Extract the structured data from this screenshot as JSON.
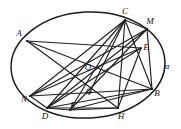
{
  "figure": {
    "background_color": "#ffffff",
    "stroke_color": "#1f1f1f",
    "width": 181,
    "height": 129,
    "conic": {
      "name": "alpha",
      "label": "α",
      "label_x": 167,
      "label_y": 66,
      "center_x": 88,
      "center_y": 65,
      "radius_x": 77,
      "radius_y": 53,
      "rotation_deg": -3
    },
    "points": [
      {
        "id": "A",
        "label": "A",
        "x": 27,
        "y": 41,
        "label_x": 19,
        "label_y": 33,
        "on_conic": true
      },
      {
        "id": "C",
        "label": "C",
        "x": 125,
        "y": 20,
        "label_x": 125,
        "label_y": 11,
        "on_conic": true
      },
      {
        "id": "M",
        "label": "M",
        "x": 147,
        "y": 29,
        "label_x": 150,
        "label_y": 21,
        "on_conic": true
      },
      {
        "id": "E",
        "label": "E",
        "x": 141,
        "y": 48,
        "label_x": 146,
        "label_y": 47,
        "on_conic": false
      },
      {
        "id": "B",
        "label": "B",
        "x": 152,
        "y": 89,
        "label_x": 157,
        "label_y": 93,
        "on_conic": true
      },
      {
        "id": "H",
        "label": "H",
        "x": 118,
        "y": 108,
        "label_x": 121,
        "label_y": 116,
        "on_conic": true
      },
      {
        "id": "F",
        "label": "F",
        "x": 70,
        "y": 110,
        "label_x": 73,
        "label_y": 105,
        "on_conic": false
      },
      {
        "id": "D",
        "label": "D",
        "x": 47,
        "y": 108,
        "label_x": 45,
        "label_y": 116,
        "on_conic": true
      },
      {
        "id": "N",
        "label": "N",
        "x": 30,
        "y": 96,
        "label_x": 24,
        "label_y": 99,
        "on_conic": true
      },
      {
        "id": "O",
        "label": "O",
        "x": 88,
        "y": 70,
        "label_x": 88,
        "label_y": 67,
        "on_conic": false
      },
      {
        "id": "G",
        "label": "G",
        "x": 89,
        "y": 94,
        "label_x": 89,
        "label_y": 91,
        "on_conic": false
      }
    ],
    "chords": [
      {
        "from": "A",
        "to": "B"
      },
      {
        "from": "A",
        "to": "H"
      },
      {
        "from": "A",
        "to": "E"
      },
      {
        "from": "C",
        "to": "N"
      },
      {
        "from": "C",
        "to": "D"
      },
      {
        "from": "C",
        "to": "F"
      },
      {
        "from": "C",
        "to": "G"
      },
      {
        "from": "C",
        "to": "H"
      },
      {
        "from": "C",
        "to": "M"
      },
      {
        "from": "C",
        "to": "B"
      },
      {
        "from": "M",
        "to": "D"
      },
      {
        "from": "M",
        "to": "N"
      },
      {
        "from": "M",
        "to": "B"
      },
      {
        "from": "M",
        "to": "F"
      },
      {
        "from": "E",
        "to": "D"
      },
      {
        "from": "E",
        "to": "N"
      },
      {
        "from": "E",
        "to": "H"
      },
      {
        "from": "B",
        "to": "N"
      },
      {
        "from": "B",
        "to": "D"
      },
      {
        "from": "B",
        "to": "F"
      },
      {
        "from": "H",
        "to": "D"
      },
      {
        "from": "N",
        "to": "D"
      },
      {
        "from": "D",
        "to": "F"
      },
      {
        "from": "F",
        "to": "H"
      }
    ]
  }
}
